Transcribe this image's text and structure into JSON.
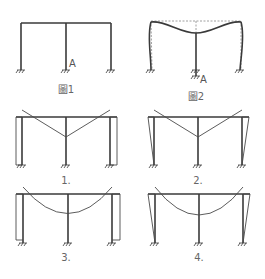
{
  "figures": {
    "fig1": {
      "caption": "圖1",
      "point_label": "A"
    },
    "fig2": {
      "caption": "圖2",
      "point_label": "A"
    }
  },
  "options": [
    {
      "label": "1.",
      "diagram": "triangular beam moment, rectangular column moment"
    },
    {
      "label": "2.",
      "diagram": "triangular beam moment, tapered column moment"
    },
    {
      "label": "3.",
      "diagram": "parabolic beam moment, rectangular column moment"
    },
    {
      "label": "4.",
      "diagram": "parabolic beam moment, tapered column moment"
    }
  ],
  "colors": {
    "line": "#3a3a3a",
    "dashed": "#888888",
    "text": "#555555"
  }
}
